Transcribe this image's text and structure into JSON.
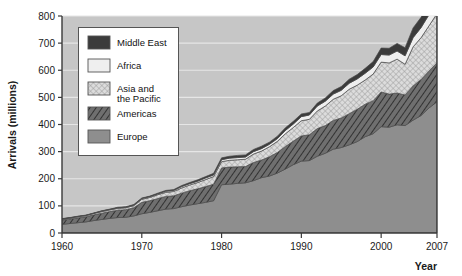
{
  "chart_data": {
    "type": "area",
    "stacked": true,
    "title": "",
    "xlabel": "Year",
    "ylabel": "Arrivals (millions)",
    "xlim": [
      1960,
      2007
    ],
    "ylim": [
      0,
      800
    ],
    "xticks": [
      1960,
      1970,
      1980,
      1990,
      2000,
      2007
    ],
    "yticks": [
      0,
      100,
      200,
      300,
      400,
      500,
      600,
      700,
      800
    ],
    "grid": true,
    "legend_position": "upper-left",
    "x": [
      1960,
      1961,
      1962,
      1963,
      1964,
      1965,
      1966,
      1967,
      1968,
      1969,
      1970,
      1971,
      1972,
      1973,
      1974,
      1975,
      1976,
      1977,
      1978,
      1979,
      1980,
      1981,
      1982,
      1983,
      1984,
      1985,
      1986,
      1987,
      1988,
      1989,
      1990,
      1991,
      1992,
      1993,
      1994,
      1995,
      1996,
      1997,
      1998,
      1999,
      2000,
      2001,
      2002,
      2003,
      2004,
      2005,
      2006,
      2007
    ],
    "series": [
      {
        "name": "Europe",
        "pattern": "solid-medium-gray",
        "color": "#8e8e8e",
        "values": [
          32,
          35,
          38,
          41,
          46,
          50,
          54,
          57,
          58,
          63,
          71,
          76,
          82,
          88,
          90,
          97,
          103,
          108,
          113,
          119,
          178,
          180,
          183,
          185,
          193,
          204,
          210,
          221,
          236,
          252,
          265,
          267,
          283,
          294,
          309,
          315,
          325,
          337,
          355,
          366,
          392,
          390,
          399,
          396,
          416,
          433,
          461,
          484
        ]
      },
      {
        "name": "Americas",
        "pattern": "diagonal-hatch-dark",
        "color": "#6f6f6f",
        "values": [
          16,
          17,
          18,
          19,
          21,
          23,
          25,
          27,
          28,
          30,
          42,
          43,
          45,
          47,
          47,
          50,
          53,
          55,
          58,
          61,
          62,
          63,
          61,
          60,
          67,
          65,
          71,
          76,
          83,
          87,
          93,
          95,
          102,
          102,
          106,
          109,
          115,
          119,
          120,
          122,
          128,
          122,
          117,
          113,
          126,
          133,
          136,
          143
        ]
      },
      {
        "name": "Asia and the Pacific",
        "pattern": "crosshatch-light",
        "color": "#d8d8d8",
        "values": [
          3,
          3,
          4,
          4,
          5,
          6,
          6,
          7,
          7,
          8,
          11,
          12,
          14,
          15,
          16,
          19,
          21,
          23,
          26,
          28,
          23,
          25,
          26,
          27,
          31,
          33,
          37,
          41,
          47,
          50,
          56,
          57,
          65,
          72,
          78,
          82,
          90,
          89,
          89,
          98,
          110,
          115,
          125,
          113,
          144,
          154,
          167,
          182
        ]
      },
      {
        "name": "Africa",
        "pattern": "solid-light",
        "color": "#efefef",
        "values": [
          1,
          1,
          1,
          1,
          1,
          2,
          2,
          2,
          2,
          2,
          3,
          3,
          3,
          4,
          4,
          5,
          5,
          5,
          6,
          6,
          7,
          8,
          8,
          8,
          9,
          9,
          9,
          10,
          12,
          13,
          15,
          16,
          18,
          18,
          19,
          20,
          22,
          23,
          25,
          26,
          28,
          29,
          30,
          31,
          34,
          37,
          41,
          45
        ]
      },
      {
        "name": "Middle East",
        "pattern": "solid-dark",
        "color": "#3b3b3b",
        "values": [
          1,
          1,
          1,
          1,
          1,
          1,
          1,
          2,
          2,
          2,
          2,
          2,
          3,
          3,
          3,
          4,
          4,
          5,
          5,
          6,
          7,
          7,
          8,
          8,
          8,
          9,
          8,
          9,
          10,
          10,
          10,
          9,
          11,
          12,
          13,
          14,
          15,
          16,
          18,
          20,
          24,
          25,
          28,
          30,
          36,
          38,
          41,
          47
        ]
      }
    ]
  },
  "legend": {
    "items": [
      {
        "label": "Middle East",
        "swatch": "swatch-middle-east"
      },
      {
        "label": "Africa",
        "swatch": "swatch-africa"
      },
      {
        "label": "Asia and",
        "label2": "the Pacific",
        "swatch": "swatch-asia-pacific"
      },
      {
        "label": "Americas",
        "swatch": "swatch-americas"
      },
      {
        "label": "Europe",
        "swatch": "swatch-europe"
      }
    ]
  },
  "axes": {
    "y_title": "Arrivals (millions)",
    "x_title": "Year",
    "y_tick_labels": [
      "800",
      "700",
      "600",
      "500",
      "400",
      "300",
      "200",
      "100",
      "0"
    ],
    "x_tick_labels": [
      "1960",
      "1970",
      "1980",
      "1990",
      "2000",
      "2007"
    ]
  },
  "colors": {
    "plot_background": "#c6c6c6",
    "gridline": "#e6e6e6",
    "axis": "#3a3a3a",
    "europe": "#8e8e8e",
    "americas": "#6f6f6f",
    "asia_pacific": "#d8d8d8",
    "africa": "#efefef",
    "middle_east": "#3b3b3b"
  }
}
